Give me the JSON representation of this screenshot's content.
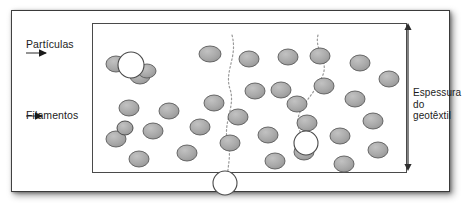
{
  "figure": {
    "type": "diagram",
    "labels": {
      "particles": "Partículas",
      "filaments": "Filamentos",
      "thickness": "Espessura\ndo\ngeotêxtil"
    },
    "colors": {
      "particle_fill": "#a8a8a8",
      "particle_stroke": "#5a5a5a",
      "frame_stroke": "#3a3a3a",
      "box_stroke": "#4a4a4a",
      "leader_stroke": "#3d3d3d",
      "flow_path_stroke": "#9a9a9a",
      "highlight_fill": "#ffffff",
      "text": "#1c1c1c",
      "background": "#ffffff"
    },
    "particles": [
      {
        "cx": 24,
        "cy": 41,
        "rx": 10,
        "ry": 8
      },
      {
        "cx": 48,
        "cy": 53,
        "rx": 10,
        "ry": 8
      },
      {
        "cx": 37,
        "cy": 85,
        "rx": 10,
        "ry": 8
      },
      {
        "cx": 77,
        "cy": 88,
        "rx": 10,
        "ry": 8
      },
      {
        "cx": 118,
        "cy": 31,
        "rx": 11,
        "ry": 8
      },
      {
        "cx": 122,
        "cy": 80,
        "rx": 10,
        "ry": 8
      },
      {
        "cx": 157,
        "cy": 36,
        "rx": 10,
        "ry": 8
      },
      {
        "cx": 163,
        "cy": 68,
        "rx": 10,
        "ry": 8
      },
      {
        "cx": 196,
        "cy": 34,
        "rx": 10,
        "ry": 8
      },
      {
        "cx": 189,
        "cy": 67,
        "rx": 10,
        "ry": 8
      },
      {
        "cx": 228,
        "cy": 33,
        "rx": 10,
        "ry": 8
      },
      {
        "cx": 232,
        "cy": 63,
        "rx": 10,
        "ry": 8
      },
      {
        "cx": 268,
        "cy": 40,
        "rx": 10,
        "ry": 8
      },
      {
        "cx": 263,
        "cy": 76,
        "rx": 10,
        "ry": 8
      },
      {
        "cx": 297,
        "cy": 56,
        "rx": 10,
        "ry": 8
      },
      {
        "cx": 24,
        "cy": 116,
        "rx": 10,
        "ry": 8
      },
      {
        "cx": 61,
        "cy": 108,
        "rx": 10,
        "ry": 8
      },
      {
        "cx": 47,
        "cy": 136,
        "rx": 10,
        "ry": 8
      },
      {
        "cx": 95,
        "cy": 130,
        "rx": 10,
        "ry": 8
      },
      {
        "cx": 108,
        "cy": 104,
        "rx": 10,
        "ry": 8
      },
      {
        "cx": 138,
        "cy": 120,
        "rx": 10,
        "ry": 8
      },
      {
        "cx": 146,
        "cy": 94,
        "rx": 10,
        "ry": 8
      },
      {
        "cx": 176,
        "cy": 112,
        "rx": 10,
        "ry": 8
      },
      {
        "cx": 183,
        "cy": 138,
        "rx": 10,
        "ry": 8
      },
      {
        "cx": 215,
        "cy": 100,
        "rx": 10,
        "ry": 8
      },
      {
        "cx": 212,
        "cy": 129,
        "rx": 10,
        "ry": 8
      },
      {
        "cx": 248,
        "cy": 113,
        "rx": 10,
        "ry": 8
      },
      {
        "cx": 252,
        "cy": 141,
        "rx": 10,
        "ry": 8
      },
      {
        "cx": 281,
        "cy": 98,
        "rx": 10,
        "ry": 8
      },
      {
        "cx": 286,
        "cy": 127,
        "rx": 10,
        "ry": 8
      },
      {
        "cx": 55,
        "cy": 48,
        "rx": 9,
        "ry": 7
      },
      {
        "cx": 205,
        "cy": 81,
        "rx": 10,
        "ry": 8
      }
    ],
    "flow_paths": [
      "M 140 12 C 146 34, 132 48, 138 66 C 144 84, 130 100, 136 120 C 140 135, 134 146, 136 160",
      "M 226 12 C 222 28, 238 38, 230 54 C 222 72, 208 82, 206 96 C 204 108, 214 114, 212 124"
    ],
    "highlight_circles": [
      {
        "cx": 39,
        "cy": 42,
        "r": 13
      },
      {
        "cx": 214,
        "cy": 120,
        "r": 12
      },
      {
        "cx": 133,
        "cy": 160,
        "r": 12
      }
    ],
    "filament_marker": {
      "cx": 33,
      "cy": 105,
      "rx": 8,
      "ry": 7
    },
    "leaders": [
      {
        "name": "particulas-leader",
        "x1": 14,
        "y1": 42,
        "x2": 34,
        "y2": 42
      },
      {
        "name": "filamentos-leader",
        "x1": 14,
        "y1": 105,
        "x2": 30,
        "y2": 105
      }
    ],
    "dimension_arrow": {
      "x": 396,
      "y_top": 12,
      "y_bottom": 160
    }
  }
}
